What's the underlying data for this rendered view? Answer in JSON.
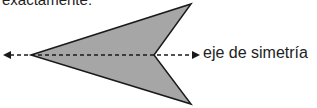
{
  "top_text": "exactamente:",
  "diagram": {
    "label": "eje de simetría",
    "shape_fill": "#a6a6a6",
    "stroke": "#1a1a1a"
  }
}
